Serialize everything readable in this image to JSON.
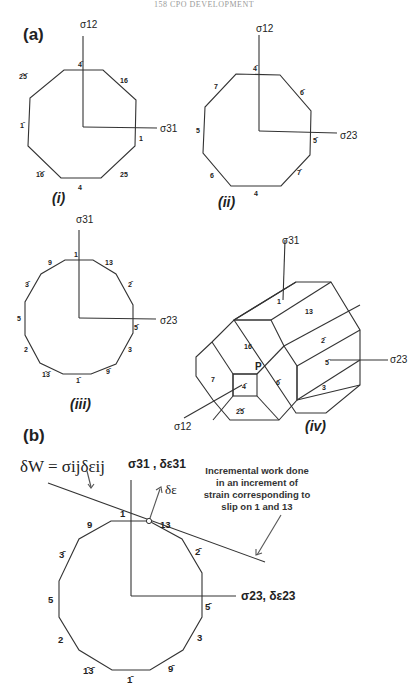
{
  "header": {
    "text": "158 CPO DEVELOPMENT"
  },
  "panel_a": {
    "label": "(a)",
    "diagram_i": {
      "caption": "(i)",
      "axis_vertical": "σ12",
      "axis_horizontal": "σ31",
      "facets": [
        "4̄",
        "16",
        "1",
        "25",
        "4",
        "1̄6̄",
        "1̄",
        "2̄5̄"
      ]
    },
    "diagram_ii": {
      "caption": "(ii)",
      "axis_vertical": "σ12",
      "axis_horizontal": "σ23",
      "facets": [
        "4̄",
        "6̄",
        "5̄",
        "7̄",
        "4",
        "6",
        "5",
        "7"
      ]
    },
    "diagram_iii": {
      "caption": "(iii)",
      "axis_vertical": "σ31",
      "axis_horizontal": "σ23",
      "facets": [
        "1",
        "13",
        "2̄",
        "5̄",
        "3",
        "9̄",
        "1̄",
        "1̄3̄",
        "2",
        "5",
        "3̄",
        "9"
      ]
    },
    "diagram_iv": {
      "caption": "(iv)",
      "axis_vertical": "σ31",
      "axis_horizontal": "σ23",
      "axis_depth": "σ12",
      "point": "P",
      "facets": [
        "1",
        "13",
        "2̄",
        "5̄",
        "3",
        "16",
        "7",
        "4̄",
        "6̄",
        "2̄5̄"
      ]
    }
  },
  "panel_b": {
    "label": "(b)",
    "equation": "δW = σijδεij",
    "axis_vertical": "σ31 , δε31",
    "axis_horizontal": "σ23, δε23",
    "strain_vector": "δε",
    "annotation": [
      "Incremental work done",
      "in an increment of",
      "strain corresponding to",
      "slip on 1 and 13"
    ],
    "facets": [
      "1",
      "13",
      "2̄",
      "5̄",
      "3",
      "9̄",
      "1̄",
      "1̄3̄",
      "2",
      "5",
      "3̄",
      "9"
    ]
  }
}
